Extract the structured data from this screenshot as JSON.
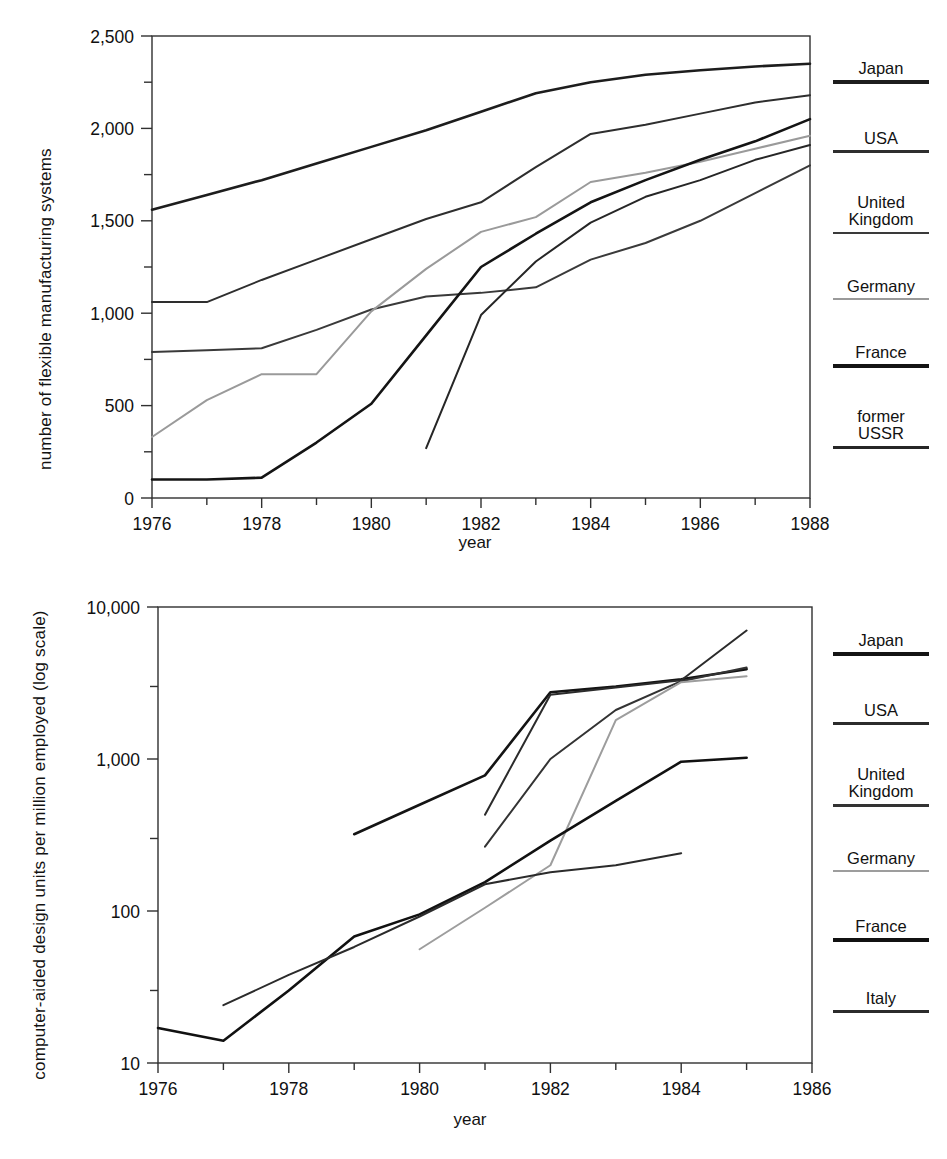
{
  "charts": [
    {
      "id": "fms",
      "ylabel": "number of flexible manufacturing systems",
      "xlabel": "year",
      "yticks": [
        "0",
        "500",
        "1,000",
        "1,500",
        "2,000",
        "2,500"
      ],
      "xticks": [
        "1976",
        "1978",
        "1980",
        "1982",
        "1984",
        "1986",
        "1988"
      ],
      "legend": [
        {
          "label": "Japan",
          "color": "#1d1d1d",
          "width": 3.2
        },
        {
          "label": "USA",
          "color": "#2e2e2e",
          "width": 2.6
        },
        {
          "label": "United\nKingdom",
          "color": "#3a3a3a",
          "width": 2.4
        },
        {
          "label": "Germany",
          "color": "#9a9a9a",
          "width": 2.0
        },
        {
          "label": "France",
          "color": "#141414",
          "width": 3.4
        },
        {
          "label": "former\nUSSR",
          "color": "#262626",
          "width": 2.8
        }
      ]
    },
    {
      "id": "cad",
      "ylabel": "computer-aided design units per million employed\n(log scale)",
      "xlabel": "year",
      "yticks": [
        "10",
        "100",
        "1,000",
        "10,000"
      ],
      "xticks": [
        "1976",
        "1978",
        "1980",
        "1982",
        "1984",
        "1986"
      ],
      "legend": [
        {
          "label": "Japan",
          "color": "#141414",
          "width": 3.6
        },
        {
          "label": "USA",
          "color": "#2b2b2b",
          "width": 2.6
        },
        {
          "label": "United\nKingdom",
          "color": "#333333",
          "width": 2.6
        },
        {
          "label": "Germany",
          "color": "#9d9d9d",
          "width": 2.0
        },
        {
          "label": "France",
          "color": "#111111",
          "width": 3.4
        },
        {
          "label": "Italy",
          "color": "#2b2b2b",
          "width": 2.8
        }
      ]
    }
  ],
  "chart_data": [
    {
      "type": "line",
      "title": "",
      "xlabel": "year",
      "ylabel": "number of flexible manufacturing systems",
      "xlim": [
        1976,
        1988
      ],
      "ylim": [
        0,
        2500
      ],
      "yticks": [
        0,
        500,
        1000,
        1500,
        2000,
        2500
      ],
      "minor_ytick_step": 250,
      "xticks": [
        1976,
        1978,
        1980,
        1982,
        1984,
        1986,
        1988
      ],
      "minor_xtick_step": 1,
      "grid": false,
      "legend_position": "right",
      "series": [
        {
          "name": "Japan",
          "color": "#1d1d1d",
          "x": [
            1976,
            1977,
            1978,
            1979,
            1980,
            1981,
            1982,
            1983,
            1984,
            1985,
            1986,
            1987,
            1988
          ],
          "values": [
            1560,
            1640,
            1720,
            1810,
            1900,
            1990,
            2090,
            2190,
            2250,
            2290,
            2315,
            2335,
            2350
          ]
        },
        {
          "name": "USA",
          "color": "#2e2e2e",
          "x": [
            1976,
            1977,
            1978,
            1979,
            1980,
            1981,
            1982,
            1983,
            1984,
            1985,
            1986,
            1987,
            1988
          ],
          "values": [
            1060,
            1060,
            1180,
            1290,
            1400,
            1510,
            1600,
            1790,
            1970,
            2020,
            2080,
            2140,
            2180
          ]
        },
        {
          "name": "United Kingdom",
          "color": "#3a3a3a",
          "x": [
            1976,
            1977,
            1978,
            1979,
            1980,
            1981,
            1982,
            1983,
            1984,
            1985,
            1986,
            1987,
            1988
          ],
          "values": [
            790,
            800,
            810,
            910,
            1020,
            1090,
            1110,
            1140,
            1290,
            1380,
            1500,
            1650,
            1800
          ]
        },
        {
          "name": "Germany",
          "color": "#9a9a9a",
          "x": [
            1976,
            1977,
            1978,
            1979,
            1980,
            1981,
            1982,
            1983,
            1984,
            1985,
            1986,
            1987,
            1988
          ],
          "values": [
            330,
            530,
            670,
            670,
            1010,
            1240,
            1440,
            1520,
            1710,
            1760,
            1820,
            1890,
            1960
          ]
        },
        {
          "name": "France",
          "color": "#141414",
          "x": [
            1976,
            1977,
            1978,
            1979,
            1980,
            1981,
            1982,
            1983,
            1984,
            1985,
            1986,
            1987,
            1988
          ],
          "values": [
            100,
            100,
            110,
            300,
            510,
            880,
            1250,
            1430,
            1600,
            1720,
            1830,
            1930,
            2050
          ]
        },
        {
          "name": "former USSR",
          "color": "#262626",
          "x": [
            1981,
            1982,
            1983,
            1984,
            1985,
            1986,
            1987,
            1988
          ],
          "values": [
            270,
            990,
            1280,
            1490,
            1630,
            1720,
            1830,
            1910
          ]
        }
      ]
    },
    {
      "type": "line",
      "title": "",
      "xlabel": "year",
      "ylabel": "computer-aided design units per million employed (log scale)",
      "yscale": "log",
      "xlim": [
        1976,
        1986
      ],
      "ylim": [
        10,
        10000
      ],
      "yticks": [
        10,
        100,
        1000,
        10000
      ],
      "xticks": [
        1976,
        1978,
        1980,
        1982,
        1984,
        1986
      ],
      "minor_xtick_step": 1,
      "grid": false,
      "legend_position": "right",
      "series": [
        {
          "name": "Japan",
          "color": "#141414",
          "x": [
            1979,
            1980,
            1981,
            1982,
            1983,
            1984,
            1985
          ],
          "values": [
            320,
            500,
            780,
            2750,
            3000,
            3350,
            3900
          ]
        },
        {
          "name": "USA",
          "color": "#2b2b2b",
          "x": [
            1981,
            1982,
            1983,
            1984,
            1985
          ],
          "values": [
            430,
            2650,
            2950,
            3300,
            7000
          ]
        },
        {
          "name": "United Kingdom",
          "color": "#333333",
          "x": [
            1981,
            1982,
            1983,
            1984,
            1985
          ],
          "values": [
            265,
            1000,
            2100,
            3250,
            4000
          ]
        },
        {
          "name": "Germany",
          "color": "#9d9d9d",
          "x": [
            1980,
            1981,
            1982,
            1983,
            1984,
            1985
          ],
          "values": [
            56,
            105,
            200,
            1800,
            3200,
            3500
          ]
        },
        {
          "name": "France",
          "color": "#111111",
          "x": [
            1976,
            1977,
            1978,
            1979,
            1980,
            1981,
            1982,
            1983,
            1984,
            1985
          ],
          "values": [
            17,
            14,
            30,
            68,
            95,
            155,
            290,
            530,
            960,
            1020
          ]
        },
        {
          "name": "Italy",
          "color": "#2b2b2b",
          "x": [
            1977,
            1978,
            1979,
            1980,
            1981,
            1982,
            1983,
            1984
          ],
          "values": [
            24,
            38,
            58,
            92,
            150,
            180,
            200,
            240
          ]
        }
      ]
    }
  ]
}
